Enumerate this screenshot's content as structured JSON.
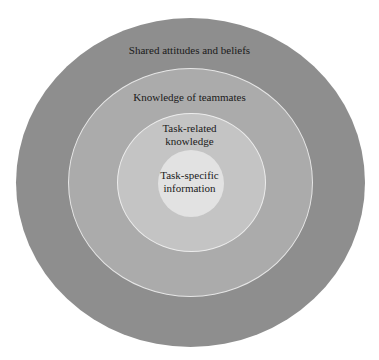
{
  "diagram": {
    "type": "concentric-circles",
    "layers": [
      {
        "level": 1,
        "label": "Shared attitudes and beliefs",
        "color": "#8e8e8e"
      },
      {
        "level": 2,
        "label": "Knowledge of teammates",
        "color": "#ababab"
      },
      {
        "level": 3,
        "label_lines": [
          "Task-related",
          "knowledge"
        ],
        "color": "#c4c4c4"
      },
      {
        "level": 4,
        "label_lines": [
          "Task-specific",
          "information"
        ],
        "color": "#e2e2e2"
      }
    ]
  }
}
